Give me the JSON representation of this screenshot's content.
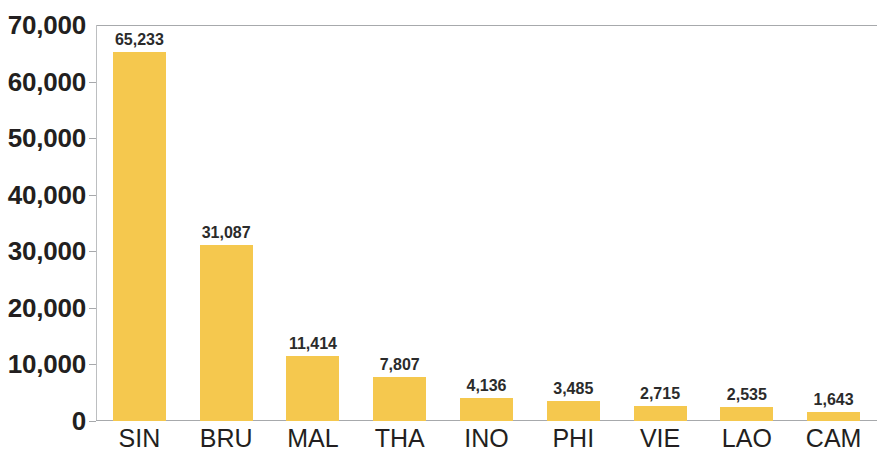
{
  "chart_data": {
    "type": "bar",
    "title": "",
    "xlabel": "",
    "ylabel": "",
    "categories": [
      "SIN",
      "BRU",
      "MAL",
      "THA",
      "INO",
      "PHI",
      "VIE",
      "LAO",
      "CAM"
    ],
    "values": [
      65233,
      31087,
      11414,
      7807,
      4136,
      3485,
      2715,
      2535,
      1643
    ],
    "value_labels": [
      "65,233",
      "31,087",
      "11,414",
      "7,807",
      "4,136",
      "3,485",
      "2,715",
      "2,535",
      "1,643"
    ],
    "ylim": [
      0,
      70000
    ],
    "y_ticks": [
      0,
      10000,
      20000,
      30000,
      40000,
      50000,
      60000,
      70000
    ],
    "y_tick_labels": [
      "0",
      "10,000",
      "20,000",
      "30,000",
      "40,000",
      "50,000",
      "60,000",
      "70,000"
    ],
    "grid": false,
    "legend": null,
    "bar_color": "#f5c84e",
    "axis_color": "#a7a9ac",
    "text_color": "#231f20"
  }
}
